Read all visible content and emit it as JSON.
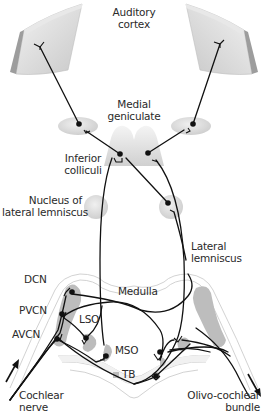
{
  "diagram": {
    "labels": {
      "auditory_cortex": [
        "Auditory",
        "cortex"
      ],
      "medial_geniculate": [
        "Medial",
        "geniculate"
      ],
      "inferior_colliculi": [
        "Inferior",
        "colliculi"
      ],
      "nucleus_lateral_lemniscus": [
        "Nucleus of",
        "lateral lemniscus"
      ],
      "lateral_lemniscus": [
        "Lateral",
        "lemniscus"
      ],
      "dcn": "DCN",
      "pvcn": "PVCN",
      "avcn": "AVCN",
      "medulla": "Medulla",
      "lso": "LSO",
      "mso": "MSO",
      "tb": "TB",
      "cochlear_nerve": [
        "Cochlear",
        "nerve"
      ],
      "olivocochlear_bundle": [
        "Olivo-cochlear",
        "bundle"
      ]
    },
    "colors": {
      "nucleus_fill": "#dcdcdc",
      "nucleus_dark": "#b8b8b8",
      "cortex_face": "#d9d9d9",
      "cortex_edge": "#9a9a9a",
      "line": "#111111",
      "outline": "#c8c8c8"
    }
  }
}
